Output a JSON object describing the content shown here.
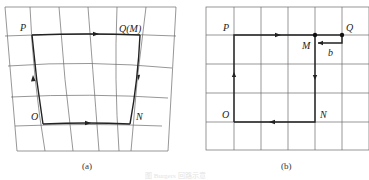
{
  "figure": {
    "panel_a": {
      "caption": "(a)",
      "labels": {
        "P": "P",
        "Q": "Q(M)",
        "O": "O",
        "N": "N"
      },
      "description": "Closed loop O→P→Q(M)→N→O on a curved (distorted) lattice grid"
    },
    "panel_b": {
      "caption": "(b)",
      "labels": {
        "P": "P",
        "Q": "Q",
        "M": "M",
        "O": "O",
        "N": "N",
        "b": "b"
      },
      "description": "Same loop mapped to a perfect square lattice; closure failure vector b from Q to M"
    },
    "figure_caption": "图 Burgers 回路示意"
  }
}
